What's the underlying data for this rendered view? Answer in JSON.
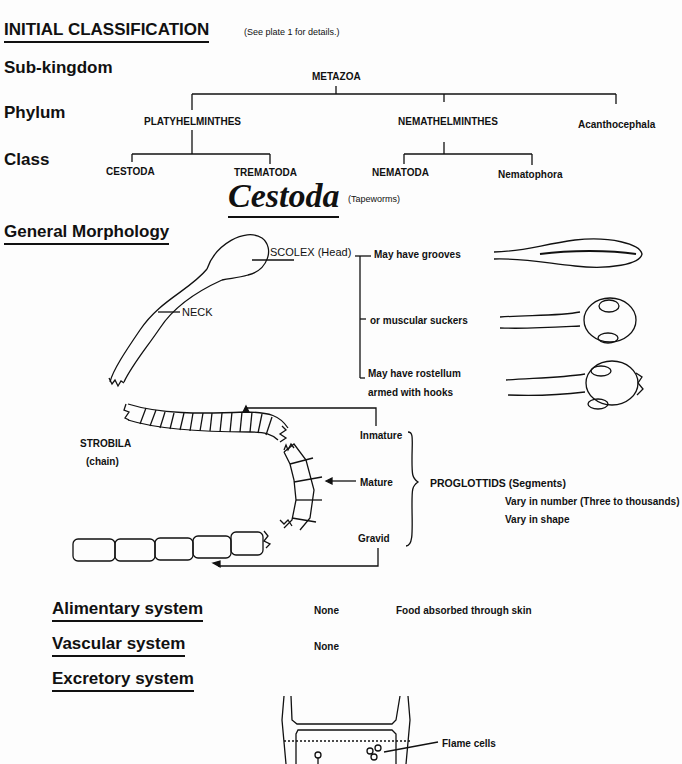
{
  "page_title_partial": "...species",
  "initial_classification": {
    "heading": "INITIAL CLASSIFICATION",
    "note": "(See plate 1 for details.)",
    "ranks": {
      "subkingdom": "Sub-kingdom",
      "phylum": "Phylum",
      "class": "Class"
    },
    "tree": {
      "subkingdom": "METAZOA",
      "phyla": [
        "PLATYHELMINTHES",
        "NEMATHELMINTHES",
        "Acanthocephala"
      ],
      "classes": {
        "platyhelminthes": [
          "CESTODA",
          "TREMATODA"
        ],
        "nemathelminthes": [
          "NEMATODA",
          "Nematophora"
        ]
      }
    }
  },
  "section": {
    "title": "Cestoda",
    "subtitle": "(Tapeworms)"
  },
  "morphology": {
    "heading": "General Morphology",
    "labels": {
      "scolex": "SCOLEX (Head)",
      "neck": "NECK",
      "strobila": "STROBILA",
      "strobila_sub": "(chain)"
    },
    "scolex_features": [
      "May have grooves",
      "or muscular suckers",
      "May have rostellum",
      "armed with  hooks"
    ],
    "proglottid_stages": [
      "Inmature",
      "Mature",
      "Gravid"
    ],
    "proglottids": {
      "label": "PROGLOTTIDS  (Segments)",
      "notes": [
        "Vary in number (Three  to  thousands)",
        "Vary in shape"
      ]
    }
  },
  "systems": [
    {
      "name": "Alimentary system",
      "value": "None",
      "note": "Food  absorbed  through skin"
    },
    {
      "name": "Vascular system",
      "value": "None",
      "note": ""
    },
    {
      "name": "Excretory system",
      "value": "",
      "note": ""
    }
  ],
  "excretory_diagram": {
    "label": "Flame  cells"
  }
}
